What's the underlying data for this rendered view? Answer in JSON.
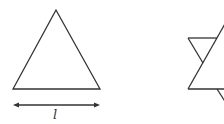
{
  "figures": {
    "left": {
      "name": "equilateral-triangle",
      "dimension_label": "l"
    },
    "right": {
      "name": "hexagram-partial"
    }
  },
  "colors": {
    "stroke": "#333333",
    "background": "#ffffff"
  }
}
